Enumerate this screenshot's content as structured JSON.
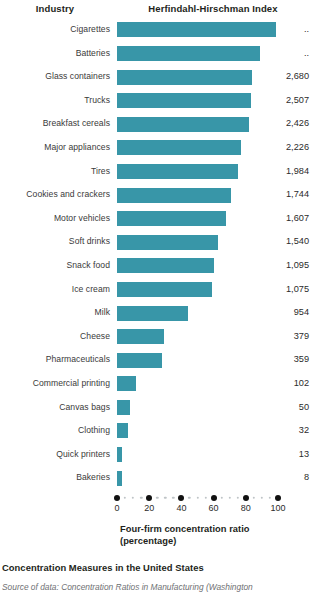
{
  "header": {
    "industry_label": "Industry",
    "hhi_label": "Herfindahl-Hirschman Index"
  },
  "axis": {
    "caption_line1": "Four-firm concentration ratio",
    "caption_line2": "(percentage)",
    "ticks": [
      "0",
      "20",
      "40",
      "60",
      "80",
      "100"
    ],
    "min": 0,
    "max": 100
  },
  "footer": {
    "title": "Concentration Measures in the United States",
    "source": "Source of data: Concentration Ratios in Manufacturing (Washington"
  },
  "colors": {
    "bar": "#3896a8",
    "tick_major": "#111111",
    "tick_minor": "#bfc4c7",
    "text": "#231f20"
  },
  "chart_data": {
    "type": "bar",
    "orientation": "horizontal",
    "title": "Concentration Measures in the United States",
    "xlabel": "Four-firm concentration ratio (percentage)",
    "ylabel": "Industry",
    "xlim": [
      0,
      100
    ],
    "grid": false,
    "legend": null,
    "categories": [
      "Cigarettes",
      "Batteries",
      "Glass containers",
      "Trucks",
      "Breakfast cereals",
      "Major appliances",
      "Tires",
      "Cookies and crackers",
      "Motor vehicles",
      "Soft drinks",
      "Snack food",
      "Ice cream",
      "Milk",
      "Cheese",
      "Pharmaceuticals",
      "Commercial printing",
      "Canvas bags",
      "Clothing",
      "Quick printers",
      "Bakeries"
    ],
    "values": [
      99,
      89,
      84,
      83,
      82,
      77,
      75,
      71,
      68,
      63,
      60,
      59,
      44,
      29,
      28,
      12,
      8,
      7,
      3,
      3
    ],
    "series": [
      {
        "name": "Four-firm concentration ratio (percentage)",
        "values": [
          99,
          89,
          84,
          83,
          82,
          77,
          75,
          71,
          68,
          63,
          60,
          59,
          44,
          29,
          28,
          12,
          8,
          7,
          3,
          3
        ]
      }
    ],
    "data_labels": {
      "name": "Herfindahl-Hirschman Index",
      "values": [
        "..",
        "..",
        "2,680",
        "2,507",
        "2,426",
        "2,226",
        "1,984",
        "1,744",
        "1,607",
        "1,540",
        "1,095",
        "1,075",
        "954",
        "379",
        "359",
        "102",
        "50",
        "32",
        "13",
        "8"
      ]
    },
    "rows": [
      {
        "industry": "Cigarettes",
        "ratio": 99,
        "hhi": ".."
      },
      {
        "industry": "Batteries",
        "ratio": 89,
        "hhi": ".."
      },
      {
        "industry": "Glass containers",
        "ratio": 84,
        "hhi": "2,680"
      },
      {
        "industry": "Trucks",
        "ratio": 83,
        "hhi": "2,507"
      },
      {
        "industry": "Breakfast cereals",
        "ratio": 82,
        "hhi": "2,426"
      },
      {
        "industry": "Major appliances",
        "ratio": 77,
        "hhi": "2,226"
      },
      {
        "industry": "Tires",
        "ratio": 75,
        "hhi": "1,984"
      },
      {
        "industry": "Cookies and crackers",
        "ratio": 71,
        "hhi": "1,744"
      },
      {
        "industry": "Motor vehicles",
        "ratio": 68,
        "hhi": "1,607"
      },
      {
        "industry": "Soft drinks",
        "ratio": 63,
        "hhi": "1,540"
      },
      {
        "industry": "Snack food",
        "ratio": 60,
        "hhi": "1,095"
      },
      {
        "industry": "Ice cream",
        "ratio": 59,
        "hhi": "1,075"
      },
      {
        "industry": "Milk",
        "ratio": 44,
        "hhi": "954"
      },
      {
        "industry": "Cheese",
        "ratio": 29,
        "hhi": "379"
      },
      {
        "industry": "Pharmaceuticals",
        "ratio": 28,
        "hhi": "359"
      },
      {
        "industry": "Commercial printing",
        "ratio": 12,
        "hhi": "102"
      },
      {
        "industry": "Canvas bags",
        "ratio": 8,
        "hhi": "50"
      },
      {
        "industry": "Clothing",
        "ratio": 7,
        "hhi": "32"
      },
      {
        "industry": "Quick printers",
        "ratio": 3,
        "hhi": "13"
      },
      {
        "industry": "Bakeries",
        "ratio": 3,
        "hhi": "8"
      }
    ]
  }
}
